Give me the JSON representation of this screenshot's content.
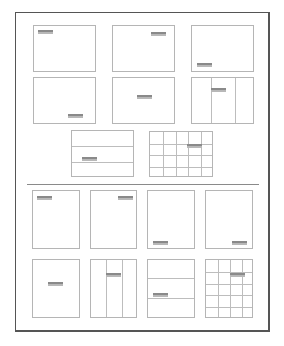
{
  "diagram": {
    "colors": {
      "frame": "#555555",
      "box_border": "#b5b5b5",
      "label_dark": "#8a8a8a",
      "label_light": "#b8b8b8",
      "divider": "#8a8a8a"
    },
    "landscape": [
      {
        "id": "top-left",
        "x": 33,
        "y": 25,
        "w": 63,
        "h": 47,
        "label": {
          "x": 4,
          "y": 4
        },
        "vlines": [],
        "hlines": []
      },
      {
        "id": "top-right",
        "x": 112,
        "y": 25,
        "w": 63,
        "h": 47,
        "label": {
          "x": 38,
          "y": 6
        },
        "vlines": [],
        "hlines": []
      },
      {
        "id": "bottom-left",
        "x": 191,
        "y": 25,
        "w": 63,
        "h": 47,
        "label": {
          "x": 5,
          "y": 37
        },
        "vlines": [],
        "hlines": []
      },
      {
        "id": "bottom-right",
        "x": 33,
        "y": 77,
        "w": 63,
        "h": 47,
        "label": {
          "x": 34,
          "y": 36
        },
        "vlines": [],
        "hlines": []
      },
      {
        "id": "center",
        "x": 112,
        "y": 77,
        "w": 63,
        "h": 47,
        "label": {
          "x": 24,
          "y": 17
        },
        "vlines": [],
        "hlines": []
      },
      {
        "id": "columns-3",
        "x": 191,
        "y": 77,
        "w": 63,
        "h": 47,
        "label": {
          "x": 19,
          "y": 10
        },
        "vlines": [
          19,
          43
        ],
        "hlines": []
      },
      {
        "id": "rows-3",
        "x": 71,
        "y": 130,
        "w": 63,
        "h": 47,
        "label": {
          "x": 10,
          "y": 26
        },
        "vlines": [],
        "hlines": [
          15,
          31
        ]
      },
      {
        "id": "grid-5x4",
        "x": 149,
        "y": 131,
        "w": 64,
        "h": 46,
        "label": {
          "x": 37,
          "y": 12
        },
        "vlines": [
          12.8,
          25.6,
          38.4,
          51.2
        ],
        "hlines": [
          11.5,
          23,
          34.5
        ]
      }
    ],
    "portrait": [
      {
        "id": "top-left",
        "x": 32,
        "y": 190,
        "w": 48,
        "h": 59,
        "label": {
          "x": 4,
          "y": 5
        },
        "vlines": [],
        "hlines": []
      },
      {
        "id": "top-right",
        "x": 90,
        "y": 190,
        "w": 47,
        "h": 59,
        "label": {
          "x": 27,
          "y": 5
        },
        "vlines": [],
        "hlines": []
      },
      {
        "id": "bottom-left",
        "x": 147,
        "y": 190,
        "w": 48,
        "h": 59,
        "label": {
          "x": 5,
          "y": 50
        },
        "vlines": [],
        "hlines": []
      },
      {
        "id": "bottom-right",
        "x": 205,
        "y": 190,
        "w": 48,
        "h": 59,
        "label": {
          "x": 26,
          "y": 50
        },
        "vlines": [],
        "hlines": []
      },
      {
        "id": "center",
        "x": 32,
        "y": 259,
        "w": 48,
        "h": 59,
        "label": {
          "x": 15,
          "y": 22
        },
        "vlines": [],
        "hlines": []
      },
      {
        "id": "columns-3",
        "x": 90,
        "y": 259,
        "w": 47,
        "h": 59,
        "label": {
          "x": 15,
          "y": 13
        },
        "vlines": [
          15,
          31
        ],
        "hlines": []
      },
      {
        "id": "rows-3",
        "x": 147,
        "y": 259,
        "w": 48,
        "h": 59,
        "label": {
          "x": 5,
          "y": 33
        },
        "vlines": [],
        "hlines": [
          18,
          38
        ]
      },
      {
        "id": "grid-4x5",
        "x": 205,
        "y": 259,
        "w": 48,
        "h": 59,
        "label": {
          "x": 24,
          "y": 13
        },
        "vlines": [
          12,
          24,
          36
        ],
        "hlines": [
          11.8,
          23.6,
          35.4,
          47.2
        ]
      }
    ]
  }
}
